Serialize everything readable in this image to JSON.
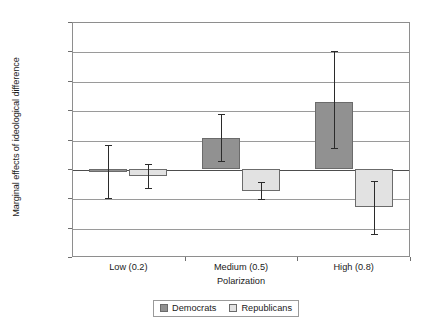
{
  "chart_data": {
    "type": "bar",
    "title": "",
    "xlabel": "Polarization",
    "ylabel": "Marginal effects of ideological difference",
    "categories": [
      "Low (0.2)",
      "Medium (0.5)",
      "High (0.8)"
    ],
    "ylim": [
      -0.15,
      0.25
    ],
    "yticks": [
      0.25,
      0.2,
      0.15,
      0.1,
      0.05,
      0,
      -0.05,
      -0.1,
      -0.15
    ],
    "ytick_labels": [
      "0.25",
      "0.2",
      "0.15",
      "0.1",
      "0.05",
      "0",
      "–0.05",
      "–0.1",
      "–0.15"
    ],
    "grid": true,
    "legend_position": "bottom-center",
    "series": [
      {
        "name": "Democrats",
        "color": "#919191",
        "values": [
          -0.005,
          0.053,
          0.113
        ],
        "error_low": [
          -0.05,
          0.013,
          0.035
        ],
        "error_high": [
          0.04,
          0.093,
          0.2
        ]
      },
      {
        "name": "Republicans",
        "color": "#e2e2e2",
        "values": [
          -0.012,
          -0.037,
          -0.065
        ],
        "error_low": [
          -0.033,
          -0.052,
          -0.11
        ],
        "error_high": [
          0.008,
          -0.022,
          -0.02
        ]
      }
    ]
  },
  "legend": {
    "items": [
      {
        "label": "Democrats",
        "swatch": "dem"
      },
      {
        "label": "Republicans",
        "swatch": "rep"
      }
    ]
  }
}
